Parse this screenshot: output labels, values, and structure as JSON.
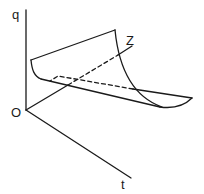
{
  "diagram": {
    "type": "3d-surface-sketch",
    "axes": {
      "vertical": "q",
      "depth": "Z",
      "horizontal": "t",
      "origin": "O"
    },
    "colors": {
      "stroke": "#1a1a1a",
      "background": "#ffffff"
    },
    "elements": [
      {
        "name": "q-axis",
        "style": "solid"
      },
      {
        "name": "z-axis",
        "style": "solid, dashed where hidden behind surface"
      },
      {
        "name": "t-axis",
        "style": "solid"
      },
      {
        "name": "curved-surface",
        "style": "solid outline with dashed hidden edge"
      }
    ]
  }
}
